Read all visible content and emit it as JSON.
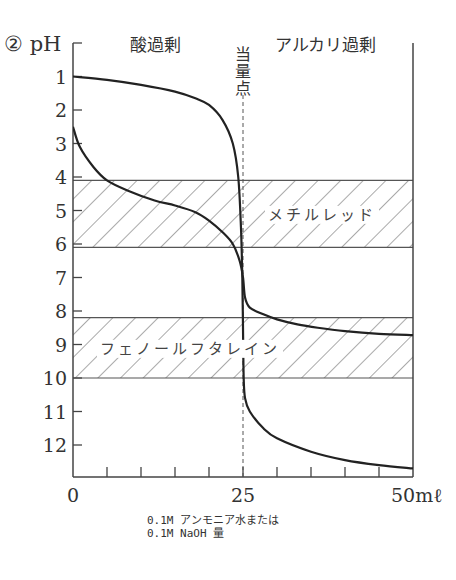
{
  "chart_data": {
    "type": "line",
    "title": "② pH",
    "ylabel": "pH",
    "xlabel_lines": [
      "0.1M アンモニア水または",
      "0.1M NaOH 量"
    ],
    "x_unit": "mℓ",
    "xlim": [
      0,
      50
    ],
    "ylim": [
      0,
      13
    ],
    "y_inverted": true,
    "y_ticks": [
      1,
      2,
      3,
      4,
      5,
      6,
      7,
      8,
      9,
      10,
      11,
      12
    ],
    "x_ticks": [
      0,
      5,
      10,
      15,
      20,
      25,
      30,
      35,
      40,
      45,
      50
    ],
    "x_tick_labels": [
      {
        "x": 0,
        "label": "0"
      },
      {
        "x": 25,
        "label": "25"
      },
      {
        "x": 50,
        "label": "50mℓ"
      }
    ],
    "region_labels": {
      "left": "酸過剰",
      "right": "アルカリ過剰"
    },
    "equivalence_point": {
      "x": 25,
      "label": "当量点"
    },
    "bands": [
      {
        "name": "メチルレッド",
        "range": [
          4.1,
          6.1
        ]
      },
      {
        "name": "フェノールフタレイン",
        "range": [
          8.2,
          10.0
        ]
      }
    ],
    "series": [
      {
        "name": "strong-acid-curve",
        "points": [
          [
            0,
            1.0
          ],
          [
            5,
            1.1
          ],
          [
            10,
            1.25
          ],
          [
            15,
            1.45
          ],
          [
            18,
            1.65
          ],
          [
            20,
            1.85
          ],
          [
            22,
            2.3
          ],
          [
            23.5,
            3.0
          ],
          [
            24.3,
            4.0
          ],
          [
            24.7,
            5.5
          ],
          [
            24.9,
            7.0
          ],
          [
            25,
            8.5
          ],
          [
            25.1,
            10.0
          ],
          [
            25.3,
            10.6
          ],
          [
            26,
            11.0
          ],
          [
            28,
            11.5
          ],
          [
            30,
            11.8
          ],
          [
            35,
            12.2
          ],
          [
            40,
            12.45
          ],
          [
            45,
            12.6
          ],
          [
            50,
            12.7
          ]
        ]
      },
      {
        "name": "weak-acid-curve",
        "points": [
          [
            0,
            2.5
          ],
          [
            1,
            3.1
          ],
          [
            3,
            3.7
          ],
          [
            5,
            4.1
          ],
          [
            8,
            4.4
          ],
          [
            12,
            4.7
          ],
          [
            15,
            4.85
          ],
          [
            18,
            5.05
          ],
          [
            20,
            5.3
          ],
          [
            22,
            5.65
          ],
          [
            23.5,
            6.0
          ],
          [
            24.5,
            6.5
          ],
          [
            25,
            7.0
          ],
          [
            25.3,
            7.6
          ],
          [
            26,
            7.9
          ],
          [
            28,
            8.1
          ],
          [
            30,
            8.25
          ],
          [
            33,
            8.4
          ],
          [
            36,
            8.5
          ],
          [
            40,
            8.6
          ],
          [
            45,
            8.68
          ],
          [
            50,
            8.72
          ]
        ]
      }
    ]
  }
}
